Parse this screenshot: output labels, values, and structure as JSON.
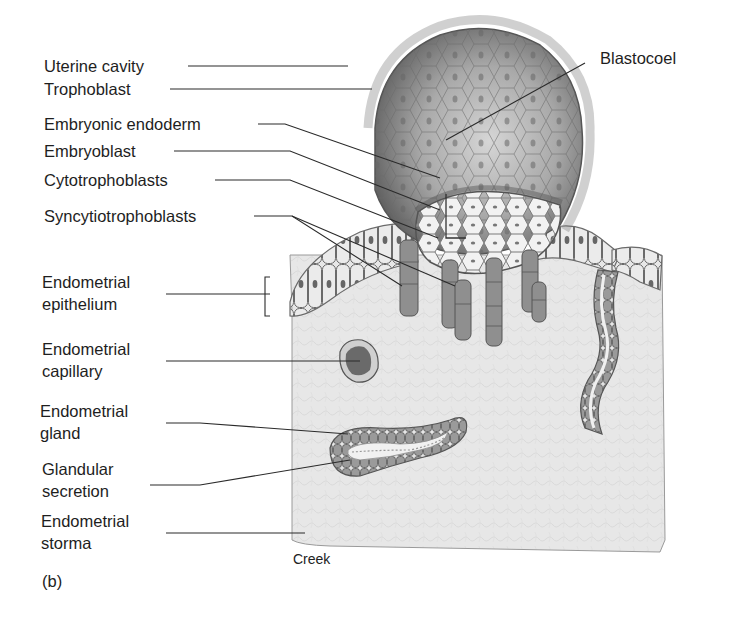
{
  "figure": {
    "panel_label": "(b)",
    "credit": "Creek",
    "labels_left": [
      {
        "id": "uterine-cavity",
        "text": "Uterine cavity"
      },
      {
        "id": "trophoblast",
        "text": "Trophoblast"
      },
      {
        "id": "embryonic-endoderm",
        "text": "Embryonic endoderm"
      },
      {
        "id": "embryoblast",
        "text": "Embryoblast"
      },
      {
        "id": "cytotrophoblasts",
        "text": "Cytotrophoblasts"
      },
      {
        "id": "syncytiotrophoblasts",
        "text": "Syncytiotrophoblasts"
      }
    ],
    "labels_two_line": [
      {
        "id": "endometrial-epithelium",
        "line1": "Endometrial",
        "line2": "epithelium"
      },
      {
        "id": "endometrial-capillary",
        "line1": "Endometrial",
        "line2": "capillary"
      },
      {
        "id": "endometrial-gland",
        "line1": "Endometrial",
        "line2": "gland"
      },
      {
        "id": "glandular-secretion",
        "line1": "Glandular",
        "line2": "secretion"
      },
      {
        "id": "endometrial-storma",
        "line1": "Endometrial",
        "line2": "storma"
      }
    ],
    "label_right": {
      "id": "blastocoel",
      "text": "Blastocoel"
    },
    "colors": {
      "ink": "#1e1e1e",
      "stroma": "#e6e6e6",
      "cell_light": "#ececec",
      "cell_mid": "#a8a8a8",
      "cell_dark": "#6e6e6e",
      "nucleus": "#555555"
    }
  }
}
